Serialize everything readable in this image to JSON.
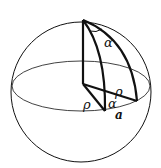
{
  "diagram": {
    "labels": {
      "alpha_top": "α",
      "rho_left": "ρ",
      "rho_right": "ρ",
      "alpha_bottom": "α",
      "a_point": "a"
    },
    "colors": {
      "stroke": "#111111",
      "background": "#ffffff"
    }
  }
}
